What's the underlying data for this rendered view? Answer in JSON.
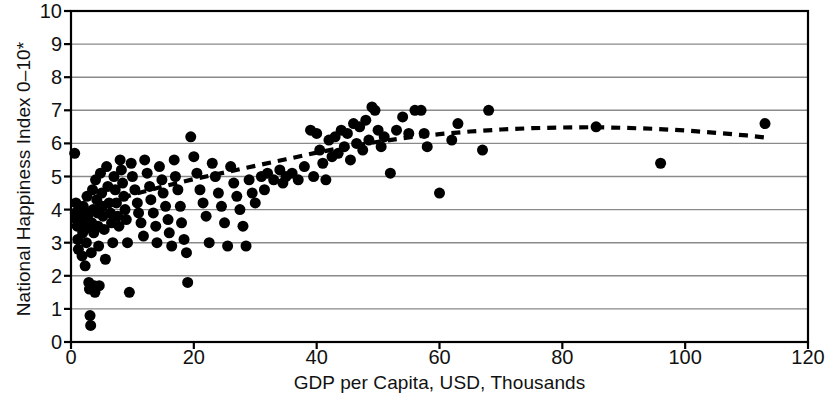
{
  "chart_data": {
    "type": "scatter",
    "title": "",
    "subtitle": "",
    "xlabel": "GDP per Capita, USD, Thousands",
    "ylabel": "National Happiness Index 0–10*",
    "xlim": [
      0,
      120
    ],
    "ylim": [
      0,
      10
    ],
    "xticks": [
      0,
      20,
      40,
      60,
      80,
      100,
      120
    ],
    "yticks": [
      0,
      1,
      2,
      3,
      4,
      5,
      6,
      7,
      8,
      9,
      10
    ],
    "grid": "horizontal",
    "legend": "none",
    "annotations": [
      "* asterisk on y-axis label denotes footnote"
    ],
    "marker": {
      "shape": "circle",
      "color": "#000000",
      "size_px": 11
    },
    "series": [
      {
        "name": "Countries",
        "type": "scatter",
        "color": "#000000",
        "points": [
          [
            0.6,
            5.7
          ],
          [
            0.8,
            4.2
          ],
          [
            0.7,
            3.9
          ],
          [
            0.9,
            3.7
          ],
          [
            1.0,
            3.5
          ],
          [
            1.1,
            3.1
          ],
          [
            1.2,
            2.8
          ],
          [
            1.4,
            3.8
          ],
          [
            1.5,
            4.0
          ],
          [
            1.6,
            3.6
          ],
          [
            1.8,
            2.6
          ],
          [
            1.9,
            3.3
          ],
          [
            2.0,
            4.1
          ],
          [
            2.1,
            3.9
          ],
          [
            2.2,
            3.4
          ],
          [
            2.3,
            2.3
          ],
          [
            2.5,
            3.0
          ],
          [
            2.6,
            4.4
          ],
          [
            2.7,
            3.8
          ],
          [
            2.8,
            3.5
          ],
          [
            2.9,
            1.8
          ],
          [
            3.0,
            1.6
          ],
          [
            3.1,
            0.8
          ],
          [
            3.2,
            0.5
          ],
          [
            3.3,
            2.7
          ],
          [
            3.4,
            3.6
          ],
          [
            3.5,
            4.6
          ],
          [
            3.6,
            4.0
          ],
          [
            3.7,
            3.3
          ],
          [
            3.8,
            1.7
          ],
          [
            3.9,
            1.5
          ],
          [
            4.0,
            4.9
          ],
          [
            4.2,
            4.3
          ],
          [
            4.3,
            3.9
          ],
          [
            4.4,
            3.5
          ],
          [
            4.5,
            2.9
          ],
          [
            4.6,
            1.7
          ],
          [
            4.8,
            5.1
          ],
          [
            5.0,
            4.5
          ],
          [
            5.1,
            4.1
          ],
          [
            5.2,
            3.8
          ],
          [
            5.4,
            3.4
          ],
          [
            5.6,
            2.5
          ],
          [
            5.8,
            5.3
          ],
          [
            6.0,
            4.7
          ],
          [
            6.2,
            4.2
          ],
          [
            6.4,
            3.9
          ],
          [
            6.6,
            3.6
          ],
          [
            6.8,
            3.0
          ],
          [
            7.0,
            5.0
          ],
          [
            7.2,
            4.6
          ],
          [
            7.4,
            4.2
          ],
          [
            7.6,
            3.8
          ],
          [
            7.8,
            3.5
          ],
          [
            8.0,
            5.5
          ],
          [
            8.2,
            5.2
          ],
          [
            8.4,
            4.8
          ],
          [
            8.6,
            4.4
          ],
          [
            8.8,
            4.0
          ],
          [
            9.0,
            3.7
          ],
          [
            9.2,
            3.0
          ],
          [
            9.5,
            1.5
          ],
          [
            9.8,
            5.4
          ],
          [
            10.0,
            5.0
          ],
          [
            10.4,
            4.6
          ],
          [
            10.8,
            4.2
          ],
          [
            11.0,
            3.9
          ],
          [
            11.4,
            3.6
          ],
          [
            11.8,
            3.2
          ],
          [
            12.0,
            5.5
          ],
          [
            12.4,
            5.1
          ],
          [
            12.8,
            4.7
          ],
          [
            13.0,
            4.3
          ],
          [
            13.4,
            3.9
          ],
          [
            13.8,
            3.5
          ],
          [
            14.0,
            3.0
          ],
          [
            14.4,
            5.3
          ],
          [
            14.8,
            4.9
          ],
          [
            15.0,
            4.5
          ],
          [
            15.4,
            4.1
          ],
          [
            15.8,
            3.7
          ],
          [
            16.0,
            3.3
          ],
          [
            16.4,
            2.9
          ],
          [
            16.8,
            5.5
          ],
          [
            17.0,
            5.0
          ],
          [
            17.4,
            4.6
          ],
          [
            17.8,
            4.1
          ],
          [
            18.0,
            3.6
          ],
          [
            18.4,
            3.1
          ],
          [
            18.8,
            2.7
          ],
          [
            19.0,
            1.8
          ],
          [
            19.5,
            6.2
          ],
          [
            20.0,
            5.6
          ],
          [
            20.5,
            5.1
          ],
          [
            21.0,
            4.6
          ],
          [
            21.5,
            4.2
          ],
          [
            22.0,
            3.8
          ],
          [
            22.5,
            3.0
          ],
          [
            23.0,
            5.4
          ],
          [
            23.5,
            5.0
          ],
          [
            24.0,
            4.5
          ],
          [
            24.5,
            4.1
          ],
          [
            25.0,
            3.6
          ],
          [
            25.5,
            2.9
          ],
          [
            26.0,
            5.3
          ],
          [
            26.5,
            4.8
          ],
          [
            27.0,
            4.4
          ],
          [
            27.5,
            4.0
          ],
          [
            28.0,
            3.5
          ],
          [
            28.5,
            2.9
          ],
          [
            29.0,
            4.9
          ],
          [
            29.5,
            4.5
          ],
          [
            30.0,
            4.2
          ],
          [
            31.0,
            5.0
          ],
          [
            31.5,
            4.6
          ],
          [
            32.0,
            5.1
          ],
          [
            33.0,
            4.9
          ],
          [
            34.0,
            5.2
          ],
          [
            34.5,
            4.8
          ],
          [
            35.0,
            5.0
          ],
          [
            36.0,
            5.1
          ],
          [
            37.0,
            4.9
          ],
          [
            38.0,
            5.3
          ],
          [
            39.0,
            6.4
          ],
          [
            39.5,
            5.0
          ],
          [
            40.0,
            6.3
          ],
          [
            40.5,
            5.8
          ],
          [
            41.0,
            5.4
          ],
          [
            41.5,
            4.9
          ],
          [
            42.0,
            6.1
          ],
          [
            42.5,
            5.6
          ],
          [
            43.0,
            6.2
          ],
          [
            43.5,
            5.7
          ],
          [
            44.0,
            6.4
          ],
          [
            44.5,
            5.9
          ],
          [
            45.0,
            6.3
          ],
          [
            45.5,
            5.5
          ],
          [
            46.0,
            6.6
          ],
          [
            46.5,
            6.0
          ],
          [
            47.0,
            6.5
          ],
          [
            47.5,
            5.8
          ],
          [
            48.0,
            6.7
          ],
          [
            48.5,
            6.1
          ],
          [
            49.0,
            7.1
          ],
          [
            49.5,
            7.0
          ],
          [
            50.0,
            6.4
          ],
          [
            50.5,
            5.9
          ],
          [
            51.0,
            6.2
          ],
          [
            52.0,
            5.1
          ],
          [
            53.0,
            6.4
          ],
          [
            54.0,
            6.8
          ],
          [
            55.0,
            6.3
          ],
          [
            56.0,
            7.0
          ],
          [
            57.0,
            7.0
          ],
          [
            57.5,
            6.3
          ],
          [
            58.0,
            5.9
          ],
          [
            60.0,
            4.5
          ],
          [
            62.0,
            6.1
          ],
          [
            63.0,
            6.6
          ],
          [
            67.0,
            5.8
          ],
          [
            68.0,
            7.0
          ],
          [
            85.5,
            6.5
          ],
          [
            96.0,
            5.4
          ],
          [
            113.0,
            6.6
          ]
        ]
      },
      {
        "name": "Trend (fitted curve)",
        "type": "line",
        "style": "dashed",
        "color": "#000000",
        "points": [
          [
            1.0,
            3.85
          ],
          [
            5.0,
            4.15
          ],
          [
            10.0,
            4.45
          ],
          [
            15.0,
            4.7
          ],
          [
            20.0,
            4.92
          ],
          [
            25.0,
            5.12
          ],
          [
            30.0,
            5.32
          ],
          [
            35.0,
            5.52
          ],
          [
            40.0,
            5.72
          ],
          [
            45.0,
            5.9
          ],
          [
            50.0,
            6.05
          ],
          [
            55.0,
            6.18
          ],
          [
            60.0,
            6.28
          ],
          [
            65.0,
            6.36
          ],
          [
            70.0,
            6.42
          ],
          [
            75.0,
            6.46
          ],
          [
            80.0,
            6.48
          ],
          [
            85.0,
            6.49
          ],
          [
            90.0,
            6.47
          ],
          [
            95.0,
            6.44
          ],
          [
            100.0,
            6.39
          ],
          [
            105.0,
            6.32
          ],
          [
            110.0,
            6.24
          ],
          [
            113.5,
            6.17
          ]
        ]
      }
    ]
  },
  "axes": {
    "x_tick_labels": [
      "0",
      "20",
      "40",
      "60",
      "80",
      "100",
      "120"
    ],
    "y_tick_labels": [
      "0",
      "1",
      "2",
      "3",
      "4",
      "5",
      "6",
      "7",
      "8",
      "9",
      "10"
    ],
    "x_title": "GDP per Capita, USD, Thousands",
    "y_title": "National Happiness Index 0–10*"
  },
  "style": {
    "background": "#ffffff",
    "axis_color": "#000000",
    "grid_color": "#8a8a8a",
    "marker_color": "#000000",
    "trend_color": "#000000"
  }
}
